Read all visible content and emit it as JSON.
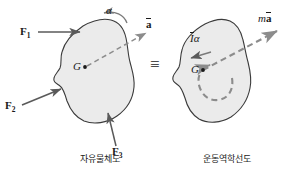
{
  "figure": {
    "type": "mechanics-equivalence-diagram",
    "background_color": "#ffffff",
    "body_fill_color": "#ebebeb",
    "outline_color": "#3a3a3a",
    "arrow_color": "#5a5a5a",
    "dashed_color": "#8c8c8c",
    "text_color": "#1a1a1a"
  },
  "left_diagram": {
    "caption": "자유물체도",
    "center_label": "G",
    "forces": [
      {
        "name": "F1",
        "base": "F",
        "sub": "1"
      },
      {
        "name": "F2",
        "base": "F",
        "sub": "2"
      },
      {
        "name": "F3",
        "base": "F",
        "sub": "3"
      }
    ],
    "angular_accel_label": "α",
    "accel_label_base": "a",
    "accel_label": "a̅"
  },
  "equivalence": {
    "symbol": "≡"
  },
  "right_diagram": {
    "caption": "운동역학선도",
    "center_label": "G",
    "moment_label_base": "I",
    "moment_label_sub": "α",
    "moment_label": "I̅α",
    "force_label_mass": "m",
    "force_label_accel": "a",
    "force_label": "ma̅"
  }
}
